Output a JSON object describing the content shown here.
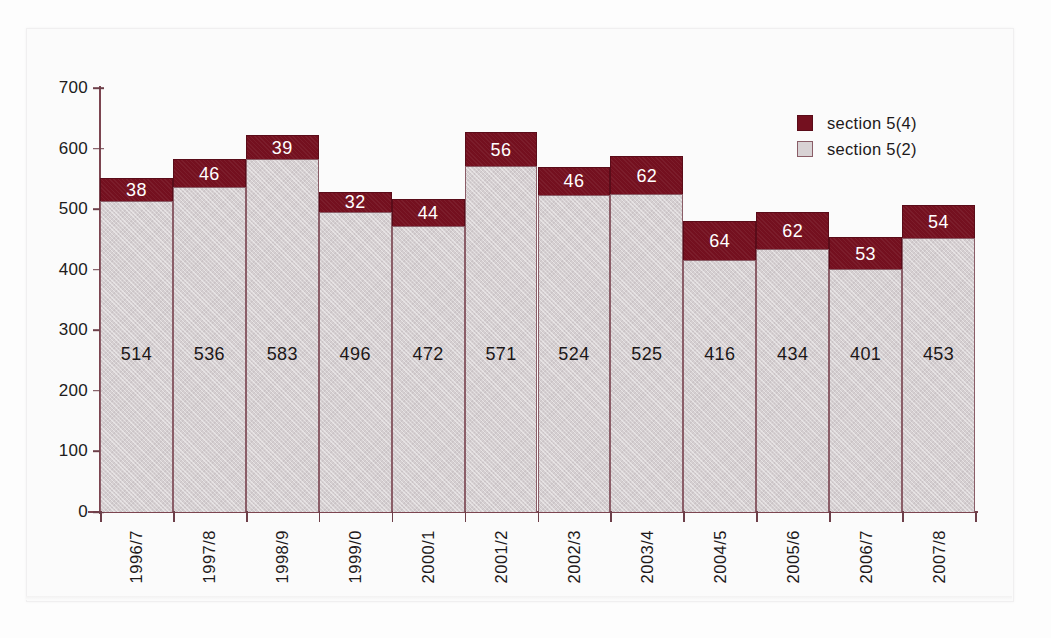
{
  "chart_data": {
    "type": "bar",
    "subtype": "stacked-vertical",
    "title": "",
    "xlabel": "",
    "ylabel": "",
    "ylim": [
      0,
      700
    ],
    "yticks": [
      0,
      100,
      200,
      300,
      400,
      500,
      600,
      700
    ],
    "grid": false,
    "legend_position": "top-right",
    "categories": [
      "1996/7",
      "1997/8",
      "1998/9",
      "1999/0",
      "2000/1",
      "2001/2",
      "2002/3",
      "2003/4",
      "2004/5",
      "2005/6",
      "2006/7",
      "2007/8"
    ],
    "series": [
      {
        "name": "section 5(2)",
        "color": "#d5cfd1",
        "values": [
          514,
          536,
          583,
          496,
          472,
          571,
          524,
          525,
          416,
          434,
          401,
          453
        ]
      },
      {
        "name": "section 5(4)",
        "color": "#74101f",
        "values": [
          38,
          46,
          39,
          32,
          44,
          56,
          46,
          62,
          64,
          62,
          53,
          54
        ]
      }
    ],
    "totals": [
      552,
      582,
      622,
      528,
      516,
      627,
      570,
      587,
      480,
      496,
      454,
      507
    ]
  },
  "legend": {
    "items": [
      {
        "label": "section 5(4)",
        "swatch": "dark"
      },
      {
        "label": "section 5(2)",
        "swatch": "light"
      }
    ]
  },
  "colors": {
    "series_dark": "#74101f",
    "series_light": "#d5cfd1",
    "axis": "#7c4550",
    "text": "#1d191a",
    "page_background": "#fdfdfd"
  }
}
